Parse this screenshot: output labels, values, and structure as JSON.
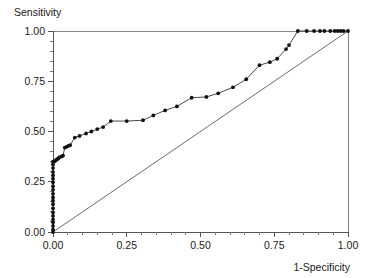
{
  "chart_data": {
    "type": "line",
    "title": "",
    "xlabel": "1-Specificity",
    "ylabel": "Sensitivity",
    "xlim": [
      0.0,
      1.0
    ],
    "ylim": [
      0.0,
      1.0
    ],
    "grid": false,
    "legend": null,
    "xticks": [
      0.0,
      0.25,
      0.5,
      0.75,
      1.0
    ],
    "xtick_labels": [
      "0.00",
      "0.25",
      "0.50",
      "0.75",
      "1.00"
    ],
    "yticks": [
      0.0,
      0.25,
      0.5,
      0.75,
      1.0
    ],
    "ytick_labels": [
      "0.00",
      "0.25",
      "0.50",
      "0.75",
      "1.00"
    ],
    "minor_ticks_per_interval": 4,
    "series": [
      {
        "name": "ROC curve",
        "marker": "filled-circle",
        "x": [
          0.0,
          0.0,
          0.0,
          0.0,
          0.0,
          0.0,
          0.0,
          0.0,
          0.0,
          0.0,
          0.0,
          0.0,
          0.0,
          0.0,
          0.0,
          0.0,
          0.0,
          0.0,
          0.0,
          0.0,
          0.0,
          0.006,
          0.01,
          0.014,
          0.018,
          0.022,
          0.03,
          0.034,
          0.04,
          0.046,
          0.052,
          0.058,
          0.074,
          0.09,
          0.112,
          0.13,
          0.15,
          0.17,
          0.196,
          0.25,
          0.305,
          0.34,
          0.38,
          0.42,
          0.47,
          0.52,
          0.56,
          0.61,
          0.655,
          0.7,
          0.735,
          0.76,
          0.79,
          0.8,
          0.83,
          0.86,
          0.885,
          0.905,
          0.92,
          0.94,
          0.955,
          0.965,
          0.975,
          0.985,
          1.0
        ],
        "y": [
          0.0,
          0.012,
          0.03,
          0.048,
          0.062,
          0.08,
          0.098,
          0.118,
          0.138,
          0.156,
          0.172,
          0.19,
          0.21,
          0.228,
          0.248,
          0.265,
          0.282,
          0.298,
          0.318,
          0.336,
          0.35,
          0.352,
          0.358,
          0.362,
          0.366,
          0.372,
          0.376,
          0.38,
          0.42,
          0.424,
          0.428,
          0.432,
          0.47,
          0.478,
          0.49,
          0.5,
          0.512,
          0.522,
          0.552,
          0.552,
          0.556,
          0.58,
          0.605,
          0.625,
          0.668,
          0.672,
          0.69,
          0.72,
          0.76,
          0.83,
          0.845,
          0.862,
          0.91,
          0.93,
          1.0,
          1.0,
          1.0,
          1.0,
          1.0,
          1.0,
          1.0,
          1.0,
          1.0,
          1.0,
          1.0
        ]
      },
      {
        "name": "reference diagonal",
        "marker": "none",
        "x": [
          0.0,
          1.0
        ],
        "y": [
          0.0,
          1.0
        ]
      }
    ]
  },
  "labels": {
    "y_axis_title": "Sensitivity",
    "x_axis_title": "1-Specificity"
  }
}
